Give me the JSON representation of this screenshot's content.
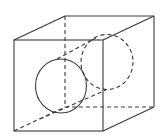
{
  "figure": {
    "stroke_color": "#3a3a3a",
    "background": "#ffffff",
    "cube": {
      "front_top_left": [
        14,
        40
      ],
      "front_top_right": [
        103,
        40
      ],
      "front_bottom_right": [
        103,
        131
      ],
      "front_bottom_left": [
        14,
        131
      ],
      "back_top_left": [
        65,
        16
      ],
      "back_top_right": [
        154,
        16
      ],
      "back_bottom_right": [
        154,
        107
      ],
      "back_bottom_left": [
        65,
        107
      ]
    },
    "front_circle": {
      "cx": 61,
      "cy": 86,
      "rx": 25.5,
      "ry": 27,
      "style": "solid"
    },
    "back_circle": {
      "cx": 107,
      "cy": 62,
      "rx": 26,
      "ry": 27.5,
      "style": "dashed"
    },
    "tangent_lines": [
      {
        "from": [
          57,
          59
        ],
        "to": [
          92,
          40
        ],
        "style": "dashed"
      },
      {
        "from": [
          14,
          131
        ],
        "to": [
          106,
          90
        ],
        "style": "dashed"
      }
    ]
  }
}
